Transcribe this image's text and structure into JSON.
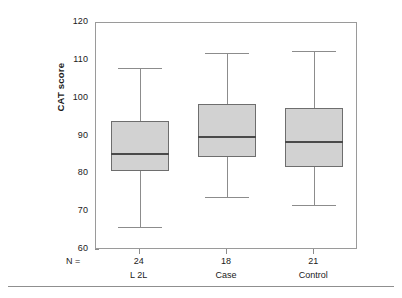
{
  "chart_data": {
    "type": "box",
    "title": "",
    "xlabel": "",
    "ylabel": "CAT score",
    "ylim": [
      60,
      120
    ],
    "yticks": [
      60,
      70,
      80,
      90,
      100,
      110,
      120
    ],
    "grid": false,
    "legend": "none",
    "n_label": "N =",
    "categories": [
      "L 2L",
      "Case",
      "Control"
    ],
    "counts": [
      24,
      18,
      21
    ],
    "boxes": [
      {
        "category": "L 2L",
        "n": 24,
        "whisker_low": 66,
        "q1": 81,
        "median": 85.5,
        "q3": 94,
        "whisker_high": 108
      },
      {
        "category": "Case",
        "n": 18,
        "whisker_low": 74,
        "q1": 84.5,
        "median": 90,
        "q3": 98.5,
        "whisker_high": 112
      },
      {
        "category": "Control",
        "n": 21,
        "whisker_low": 72,
        "q1": 82,
        "median": 88.5,
        "q3": 97.5,
        "whisker_high": 112.5
      }
    ],
    "colors": {
      "box_fill": "#d2d2d2",
      "box_border": "#6e6e6e",
      "median": "#4a4a4a",
      "whisker": "#8c8c8c",
      "axis": "#9a9a9a",
      "text": "#1a1a1a",
      "background": "#ffffff"
    }
  },
  "axis": {
    "y_tick_labels": [
      "120",
      "110",
      "100",
      "90",
      "80",
      "70",
      "60"
    ],
    "y_title": "CAT score",
    "n_prefix": "N ="
  }
}
